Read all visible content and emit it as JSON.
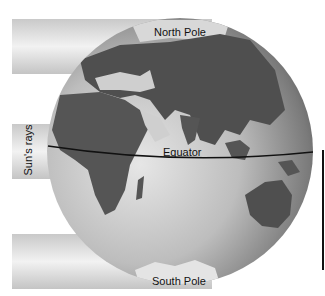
{
  "diagram": {
    "labels": {
      "north_pole": "North Pole",
      "south_pole": "South Pole",
      "equator": "Equator",
      "sun_rays": "Sun's rays"
    },
    "colors": {
      "ocean_light": "#d4d4d4",
      "ocean_dark": "#6e6e6e",
      "land": "#5a5a5a",
      "ray_band": "#dcdcdc",
      "line": "#111111",
      "background": "#ffffff"
    }
  }
}
